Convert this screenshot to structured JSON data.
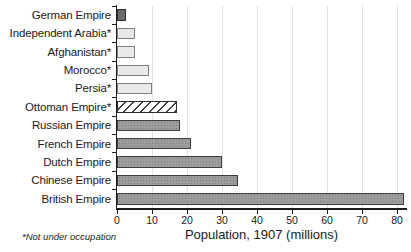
{
  "chart_data": {
    "type": "bar",
    "orientation": "horizontal",
    "title": "",
    "xlabel": "Population, 1907 (millions)",
    "footnote": "*Not under occupation",
    "categories": [
      "German Empire",
      "Independent Arabia*",
      "Afghanistan*",
      "Morocco*",
      "Persia*",
      "Ottoman Empire*",
      "Russian Empire",
      "French Empire",
      "Dutch Empire",
      "Chinese Empire",
      "British Empire"
    ],
    "values": [
      2.5,
      5,
      5,
      9,
      10,
      17,
      18,
      21,
      30,
      34.5,
      82
    ],
    "bar_styles": [
      "dark",
      "light",
      "light",
      "light",
      "light",
      "hatched",
      "medium",
      "medium",
      "medium",
      "medium",
      "medium"
    ],
    "xticks": [
      0,
      10,
      20,
      30,
      40,
      50,
      60,
      70,
      80
    ],
    "xlim": [
      0,
      82.5
    ],
    "grid": "vertical-light",
    "legend": "none",
    "colors": {
      "dark_bar": "#6b6b6b",
      "medium_bar": "#9d9d9d",
      "light_bar": "#e9e9e9",
      "hatch_stripe": "#3f3f3f",
      "bar_border_dark": "#2e2e2e",
      "bar_border_medium": "#3d3d3d",
      "bar_border_light": "#808080",
      "gridline": "#e3e3e3",
      "axis": "#1c1c1c",
      "text": "#1a1a1a"
    }
  }
}
